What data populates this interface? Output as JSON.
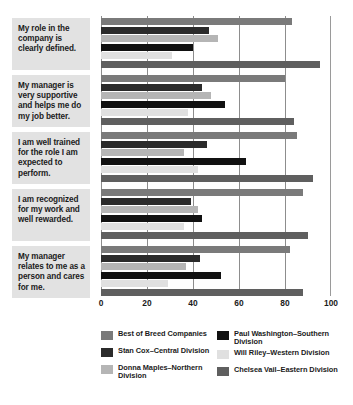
{
  "chart_data": {
    "type": "bar",
    "orientation": "horizontal",
    "title": "",
    "xlabel": "",
    "ylabel": "",
    "xlim": [
      0,
      100
    ],
    "xticks": [
      0,
      20,
      40,
      60,
      80,
      100
    ],
    "xticklabels": [
      "0",
      "20",
      "40",
      "60",
      "80",
      "100"
    ],
    "grid": true,
    "legend_position": "bottom",
    "categories": [
      "My role in the company is clearly defined.",
      "My manager is very supportive and helps me do my job better.",
      "I am well trained for the role I am expected to perform.",
      "I am recognized for my work and well rewarded.",
      "My manager relates to me as a person and cares for me."
    ],
    "series": [
      {
        "name": "Best of Breed Companies",
        "color": "#7a7a7a",
        "values": [
          83,
          80,
          85,
          88,
          82
        ]
      },
      {
        "name": "Stan Cox–Central Division",
        "color": "#2b2b2b",
        "values": [
          47,
          44,
          46,
          39,
          43
        ]
      },
      {
        "name": "Donna Maples–Northern Division",
        "color": "#b5b5b5",
        "values": [
          51,
          48,
          36,
          42,
          37
        ]
      },
      {
        "name": "Paul Washington–Southern Division",
        "color": "#111111",
        "values": [
          40,
          54,
          63,
          44,
          52
        ]
      },
      {
        "name": "Will Riley–Western Division",
        "color": "#e0e0e0",
        "values": [
          31,
          38,
          42,
          36,
          29
        ]
      },
      {
        "name": "Chelsea Vail–Eastern Division",
        "color": "#5f5f5f",
        "values": [
          95,
          84,
          92,
          90,
          88
        ]
      }
    ]
  },
  "legend": {
    "columns": [
      [
        "Best of Breed Companies",
        "Stan Cox–Central Division",
        "Donna Maples–Northern Division"
      ],
      [
        "Paul Washington–Southern Division",
        "Will Riley–Western Division",
        "Chelsea Vail–Eastern Division"
      ]
    ]
  }
}
